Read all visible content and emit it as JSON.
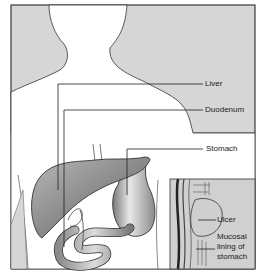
{
  "diagram": {
    "type": "anatomical-illustration",
    "colors": {
      "background_panel": "#d6d6d6",
      "body": "#ffffff",
      "organ_fill": "#9a9a9a",
      "outline": "#333333",
      "inset_bg": "#d0d0d0"
    },
    "labels": {
      "liver": "Liver",
      "duodenum": "Duodenum",
      "stomach": "Stomach",
      "ulcer": "Ulcer",
      "mucosal_line1": "Mucosal",
      "mucosal_line2": "lining of",
      "mucosal_line3": "stomach"
    }
  }
}
